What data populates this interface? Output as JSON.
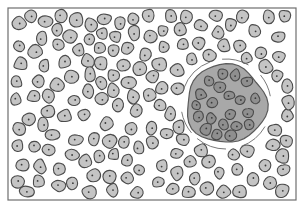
{
  "figure": {
    "colors": {
      "background": "#ffffff",
      "frame": "#6e6e6e",
      "cell_fill": "#c4c4c4",
      "cell_stroke": "#4a4a4a",
      "nucleus": "#3a3a3a",
      "cluster_fill": "#a8a8a8",
      "cluster_stroke": "#5a5a5a",
      "cluster_cell_fill": "#8f8f8f",
      "capsule_arc": "#6a6a6a"
    },
    "frame": {
      "x": 8,
      "y": 8,
      "width": 288,
      "height": 192
    },
    "cluster": {
      "cx": 226,
      "cy": 104,
      "rx": 40,
      "ry": 40
    }
  }
}
